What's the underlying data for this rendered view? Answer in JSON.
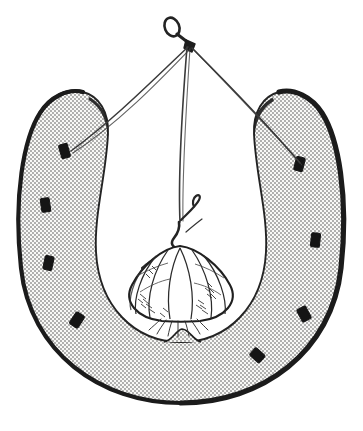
{
  "illustration": {
    "title": "Garlic bulb hanging from a nail inside a horseshoe",
    "medium": "black-and-white pen-and-ink line drawing with stipple shading",
    "background_color": "#ffffff",
    "ink_color": "#1a1a1a",
    "canvas": {
      "width": 363,
      "height": 431
    }
  },
  "objects": {
    "horseshoe": {
      "label": "horseshoe",
      "orientation": "U-shape, opening upward",
      "outer_rim_color": "#1c1c1c",
      "body_fill": "stipple-dot-texture",
      "stipple_dot_color": "#3a3a3a",
      "body_base_color": "#f7f7f5",
      "nail_hole_count_left": 4,
      "nail_hole_count_right": 4,
      "nail_hole_color": "#181818",
      "toe_clip": "small triangular bump at bottom inner edge",
      "bounds": {
        "left": 18,
        "right": 345,
        "top": 88,
        "bottom": 403
      }
    },
    "wall_nail": {
      "label": "wall nail",
      "head_shape": "oval ring head, tilted",
      "position": {
        "x": 178,
        "y": 30
      },
      "color": "#222222"
    },
    "strings": {
      "label": "hanging strings",
      "color": "#3b3b3b",
      "strands": [
        {
          "name": "left-string",
          "from": "nail-knot",
          "to": "left-arm-nail-hole"
        },
        {
          "name": "center-string",
          "from": "nail-knot",
          "to": "garlic-stem"
        },
        {
          "name": "right-string",
          "from": "nail-knot",
          "to": "right-arm-nail-hole"
        }
      ]
    },
    "garlic": {
      "label": "garlic bulb",
      "clove_line_count": 7,
      "stem": "bent dry stalk with hooked tip",
      "roots": "fine root hairs at base",
      "outline_color": "#232323",
      "bounds": {
        "left": 125,
        "right": 236,
        "top": 228,
        "bottom": 322
      }
    }
  }
}
